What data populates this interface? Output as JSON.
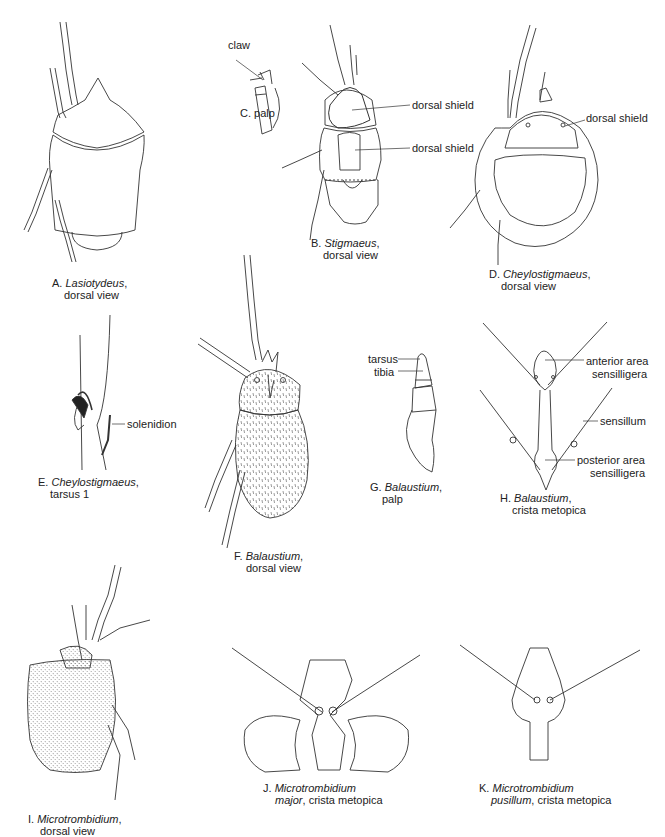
{
  "figures": {
    "A": {
      "letter": "A.",
      "genus": "Lasiotydeus",
      "suffix": ",",
      "line2": "dorsal view"
    },
    "B": {
      "letter": "B.",
      "genus": "Stigmaeus",
      "suffix": ",",
      "line2": "dorsal view",
      "labels": [
        "dorsal shield",
        "dorsal shield"
      ]
    },
    "C": {
      "letter": "C.",
      "title": "palp",
      "labels": [
        "claw"
      ]
    },
    "D": {
      "letter": "D.",
      "genus": "Cheylostigmaeus",
      "suffix": ",",
      "line2": "dorsal view",
      "labels": [
        "dorsal shield"
      ]
    },
    "E": {
      "letter": "E.",
      "genus": "Cheylostigmaeus",
      "suffix": ",",
      "line2": "tarsus 1",
      "labels": [
        "solenidion"
      ]
    },
    "F": {
      "letter": "F.",
      "genus": "Balaustium",
      "suffix": ",",
      "line2": "dorsal view"
    },
    "G": {
      "letter": "G.",
      "genus": "Balaustium",
      "suffix": ",",
      "line2": "palp",
      "labels": [
        "tarsus",
        "tibia"
      ]
    },
    "H": {
      "letter": "H.",
      "genus": "Balaustium",
      "suffix": ",",
      "line2": "crista metopica",
      "labels": [
        "anterior area",
        "sensilligera",
        "sensillum",
        "posterior area",
        "sensilligera"
      ]
    },
    "I": {
      "letter": "I.",
      "genus": "Microtrombidium",
      "suffix": ",",
      "line2": "dorsal view"
    },
    "J": {
      "letter": "J.",
      "genus": "Microtrombidium",
      "line2_italic": "major",
      "line2": ", crista metopica"
    },
    "K": {
      "letter": "K.",
      "genus": "Microtrombidium",
      "line2_italic": "pusillum",
      "line2": ", crista metopica"
    }
  }
}
